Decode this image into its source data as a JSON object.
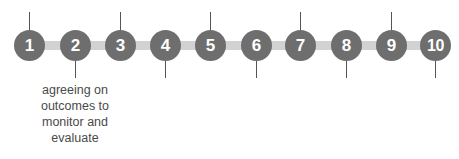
{
  "diagram": {
    "steps": [
      {
        "label": "1",
        "x": 29,
        "tick": "up"
      },
      {
        "label": "2",
        "x": 75,
        "tick": "down"
      },
      {
        "label": "3",
        "x": 120,
        "tick": "up"
      },
      {
        "label": "4",
        "x": 165,
        "tick": "down"
      },
      {
        "label": "5",
        "x": 210,
        "tick": "up"
      },
      {
        "label": "6",
        "x": 256,
        "tick": "down"
      },
      {
        "label": "7",
        "x": 300,
        "tick": "up"
      },
      {
        "label": "8",
        "x": 346,
        "tick": "down"
      },
      {
        "label": "9",
        "x": 391,
        "tick": "up"
      },
      {
        "label": "10",
        "x": 435,
        "tick": "down"
      }
    ],
    "caption_step_2": "agreeing on outcomes to monitor and evaluate",
    "colors": {
      "circle": "#6e6e6e",
      "bar": "#d2d2d2",
      "tick": "#555555",
      "text": "#4a4a4a"
    }
  }
}
